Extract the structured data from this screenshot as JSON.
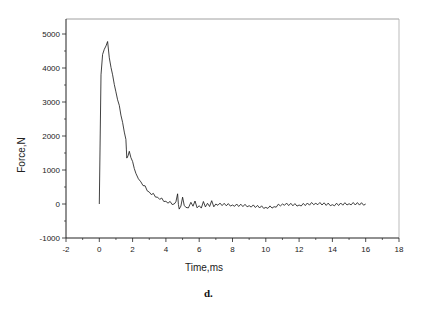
{
  "chart_data": {
    "type": "line",
    "title": "",
    "caption": "d.",
    "xlabel": "Time,ms",
    "ylabel": "Force,N",
    "xlim": [
      -2,
      18
    ],
    "ylim": [
      -1000,
      5500
    ],
    "xticks": [
      -2,
      0,
      2,
      4,
      6,
      8,
      10,
      12,
      14,
      16,
      18
    ],
    "yticks": [
      -1000,
      0,
      1000,
      2000,
      3000,
      4000,
      5000
    ],
    "grid": false,
    "legend": null,
    "series": [
      {
        "name": "Force",
        "x": [
          0,
          0.1,
          0.2,
          0.3,
          0.4,
          0.5,
          0.6,
          0.8,
          1.0,
          1.2,
          1.4,
          1.6,
          1.65,
          1.8,
          2.0,
          2.2,
          2.5,
          3.0,
          3.5,
          4.0,
          4.5,
          4.7,
          4.8,
          5.0,
          5.2,
          5.5,
          6.0,
          6.5,
          7.0,
          8.0,
          9.0,
          10.0,
          10.5,
          11.0,
          12.0,
          13.0,
          14.0,
          15.0,
          16.0
        ],
        "y": [
          0,
          3800,
          4400,
          4550,
          4650,
          4780,
          4300,
          3800,
          3300,
          2900,
          2400,
          1900,
          1350,
          1550,
          1250,
          900,
          650,
          350,
          200,
          80,
          0,
          300,
          -150,
          200,
          -100,
          50,
          -50,
          20,
          0,
          -30,
          -50,
          -100,
          -80,
          0,
          -30,
          20,
          -20,
          10,
          0
        ]
      }
    ]
  }
}
